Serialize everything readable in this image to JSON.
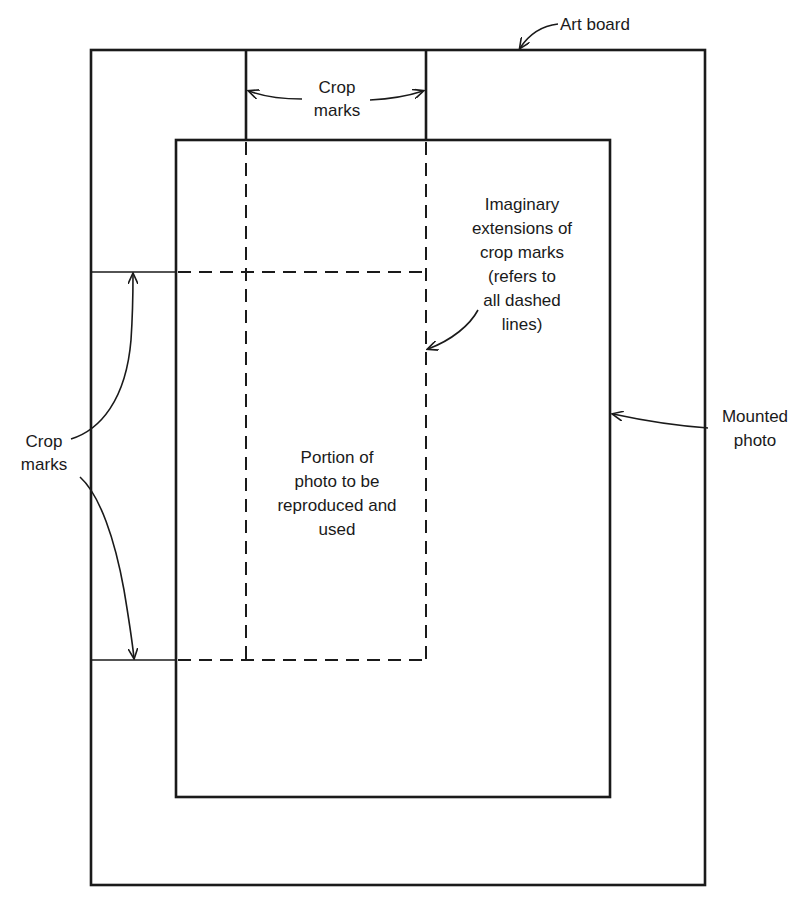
{
  "diagram": {
    "labels": {
      "art_board": "Art board",
      "top_crop_marks": [
        "Crop",
        "marks"
      ],
      "imaginary_extensions": [
        "Imaginary",
        "extensions of",
        "crop marks",
        "(refers to",
        "all dashed",
        "lines)"
      ],
      "left_crop_marks": [
        "Crop",
        "marks"
      ],
      "mounted_photo": [
        "Mounted",
        "photo"
      ],
      "portion_used": [
        "Portion of",
        "photo to be",
        "reproduced and",
        "used"
      ]
    },
    "colors": {
      "line": "#1a1a1a",
      "background": "#ffffff"
    }
  }
}
